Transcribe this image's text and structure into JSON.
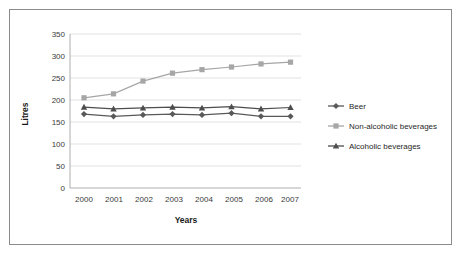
{
  "chart_data": {
    "type": "line",
    "title": "",
    "xlabel": "Years",
    "ylabel": "Litres",
    "categories": [
      "2000",
      "2001",
      "2002",
      "2003",
      "2004",
      "2005",
      "2006",
      "2007"
    ],
    "ylim": [
      0,
      350
    ],
    "yticks": [
      0,
      50,
      100,
      150,
      200,
      250,
      300,
      350
    ],
    "grid": true,
    "legend_position": "right",
    "series": [
      {
        "name": "Beer",
        "marker": "diamond",
        "color": "#595959",
        "values": [
          168,
          163,
          166,
          168,
          166,
          170,
          163,
          163
        ]
      },
      {
        "name": "Non-alcoholic beverages",
        "marker": "square",
        "color": "#a6a6a6",
        "values": [
          205,
          214,
          243,
          261,
          269,
          275,
          282,
          286
        ]
      },
      {
        "name": "Alcoholic beverages",
        "marker": "triangle",
        "color": "#4d4d4d",
        "values": [
          184,
          180,
          182,
          184,
          182,
          185,
          180,
          183
        ]
      }
    ]
  },
  "axis": {
    "y_title": "Litres",
    "x_title": "Years",
    "y_tick_labels": [
      "350",
      "300",
      "250",
      "200",
      "150",
      "100",
      "50",
      "0"
    ],
    "x_tick_labels": [
      "2000",
      "2001",
      "2002",
      "2003",
      "2004",
      "2005",
      "2006",
      "2007"
    ]
  },
  "legend": {
    "entries": [
      {
        "label": "Beer",
        "marker": "diamond-marker-icon",
        "color": "#595959"
      },
      {
        "label": "Non-alcoholic beverages",
        "marker": "square-marker-icon",
        "color": "#a6a6a6"
      },
      {
        "label": "Alcoholic beverages",
        "marker": "triangle-marker-icon",
        "color": "#4d4d4d"
      }
    ]
  },
  "colors": {
    "frame_border": "#8a8a8a",
    "gridline": "#d4d4d4",
    "axis": "#9a9a9a",
    "background": "#ffffff"
  }
}
